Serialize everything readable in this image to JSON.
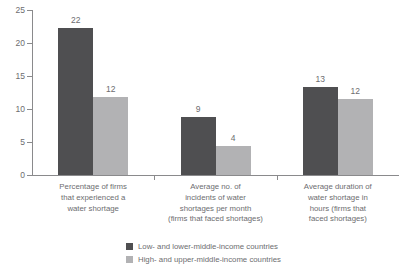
{
  "chart_data": {
    "type": "bar",
    "title": "",
    "subtitle": "",
    "xlabel": "",
    "ylabel": "",
    "ylim": [
      0,
      25
    ],
    "yticks": [
      0,
      5,
      10,
      15,
      20,
      25
    ],
    "ytick_labels": [
      "0",
      "5",
      "10",
      "15",
      "20",
      "25"
    ],
    "grid": false,
    "legend_position": "bottom",
    "categories": [
      "Percentage of firms that experienced a water shortage",
      "Average no. of incidents of water shortages per month (firms that faced shortages)",
      "Average duration of water shortage in hours (firms that faced shortages)"
    ],
    "category_lines": [
      [
        "Percentage of firms",
        "that experienced a",
        "water shortage"
      ],
      [
        "Average no. of",
        "incidents of water",
        "shortages per month",
        "(firms that faced shortages)"
      ],
      [
        "Average duration of",
        "water shortage in",
        "hours (firms that",
        "faced shortages)"
      ]
    ],
    "series": [
      {
        "name": "Low- and lower-middle-income countries",
        "color": "#4f4f51",
        "values": [
          22.3,
          8.8,
          13.4
        ],
        "labels": [
          "22",
          "9",
          "13"
        ]
      },
      {
        "name": "High- and upper-middle-income countries",
        "color": "#b2b2b4",
        "values": [
          11.8,
          4.4,
          11.5
        ],
        "labels": [
          "12",
          "4",
          "12"
        ]
      }
    ]
  },
  "legend": {
    "entries": [
      {
        "label": "Low- and lower-middle-income countries",
        "color": "#4f4f51"
      },
      {
        "label": "High- and upper-middle-income countries",
        "color": "#b2b2b4"
      }
    ]
  },
  "axis": {
    "y_labels": [
      "25",
      "20",
      "15",
      "10",
      "5",
      "0"
    ]
  }
}
